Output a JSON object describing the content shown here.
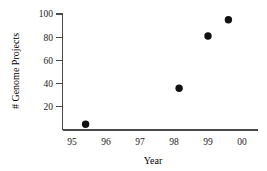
{
  "chart_data": {
    "type": "scatter",
    "title": "",
    "xlabel": "Year",
    "ylabel": "# Genome Projects",
    "x": [
      95.4,
      98.15,
      99.0,
      99.6
    ],
    "values": [
      5,
      36,
      81,
      95
    ],
    "points": [
      {
        "x": 95.4,
        "y": 5
      },
      {
        "x": 98.15,
        "y": 36
      },
      {
        "x": 99.0,
        "y": 81
      },
      {
        "x": 99.6,
        "y": 95
      }
    ],
    "xlim": [
      94.6,
      100.4
    ],
    "ylim": [
      0,
      104
    ],
    "xticklabels": [
      "95",
      "96",
      "97",
      "98",
      "99",
      "00"
    ],
    "xtickvalues": [
      95,
      96,
      97,
      98,
      99,
      100
    ],
    "yticklabels": [
      "20",
      "40",
      "60",
      "80",
      "100"
    ],
    "ytickvalues": [
      20,
      40,
      60,
      80,
      100
    ],
    "grid": false,
    "legend": null,
    "marker": "filled-circle",
    "marker_color": "#111111",
    "axis_color": "#4a4a4a"
  }
}
